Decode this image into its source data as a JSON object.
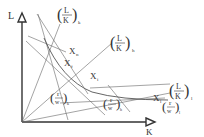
{
  "diagram": {
    "axes": {
      "y_label": "L",
      "x_label": "K"
    },
    "rays": [
      {
        "id": "k",
        "label_num": "L",
        "label_den": "K",
        "subscript": "k"
      },
      {
        "id": "h",
        "label_num": "L",
        "label_den": "K",
        "subscript": "h"
      },
      {
        "id": "l",
        "label_num": "L",
        "label_den": "K",
        "subscript": "l"
      }
    ],
    "points": [
      {
        "id": "n",
        "label": "X",
        "subscript": "n"
      },
      {
        "id": "f",
        "label": "X",
        "subscript": "f"
      },
      {
        "id": "i",
        "label": "X",
        "subscript": "i"
      },
      {
        "id": "l",
        "label": "X",
        "subscript": "l"
      }
    ],
    "isocosts": [
      {
        "id": "k",
        "label_num": "r",
        "label_den": "w",
        "subscript": "k"
      },
      {
        "id": "h",
        "label_num": "r",
        "label_den": "w",
        "subscript": "h"
      },
      {
        "id": "l",
        "label_num": "r",
        "label_den": "w",
        "subscript": "l"
      }
    ],
    "colors": {
      "line": "#555555",
      "axis": "#333333"
    }
  }
}
